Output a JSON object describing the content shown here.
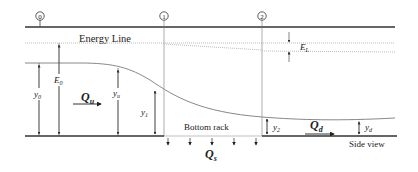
{
  "diagram": {
    "title_label": "Energy Line",
    "side_view_label": "Side view",
    "bottom_rack_label": "Bottom rack",
    "sections": [
      {
        "id": "0",
        "label": "0",
        "x": 40
      },
      {
        "id": "1",
        "label": "1",
        "x": 164
      },
      {
        "id": "2",
        "label": "2",
        "x": 262
      }
    ],
    "labels": {
      "y0": {
        "base": "y",
        "sub": "0"
      },
      "E0": {
        "base": "E",
        "sub": "0"
      },
      "Qu": {
        "base": "Q",
        "sub": "u"
      },
      "yu": {
        "base": "y",
        "sub": "u"
      },
      "y1": {
        "base": "y",
        "sub": "1"
      },
      "y2": {
        "base": "y",
        "sub": "2"
      },
      "Qd": {
        "base": "Q",
        "sub": "d"
      },
      "yd": {
        "base": "y",
        "sub": "d"
      },
      "Qs": {
        "base": "Q",
        "sub": "s"
      },
      "EL": {
        "base": "E",
        "sub": "L"
      }
    },
    "colors": {
      "line": "#333333",
      "water_surface": "#888888",
      "energy_line": "#aaaaaa",
      "text": "#222222"
    }
  }
}
